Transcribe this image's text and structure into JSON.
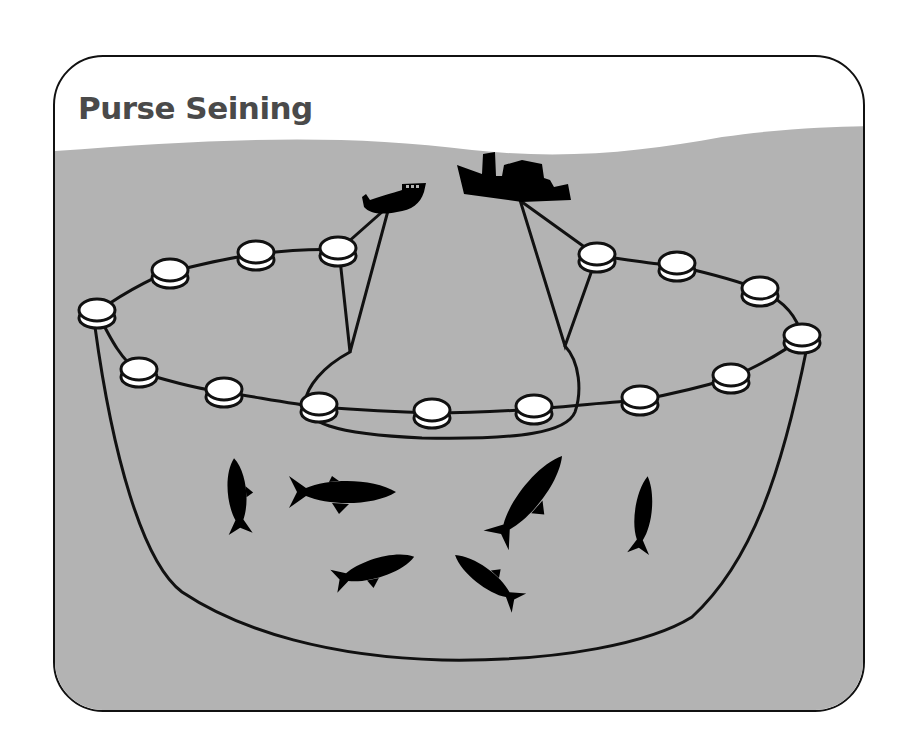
{
  "diagram": {
    "title": "Purse Seining",
    "colors": {
      "water": "#b3b3b3",
      "sky": "#ffffff",
      "outline": "#111111",
      "float_fill": "#ffffff",
      "title_text": "#4a4a4a",
      "silhouette": "#000000"
    },
    "elements": {
      "vessels": [
        {
          "name": "skiff-boat",
          "role": "small skiff holding one end of the net"
        },
        {
          "name": "purse-seiner-ship",
          "role": "main fishing vessel with smokestack"
        }
      ],
      "float_count": 16,
      "fish_count": 7,
      "net": "purse seine net encircling a school of fish, closed at the bottom"
    }
  }
}
